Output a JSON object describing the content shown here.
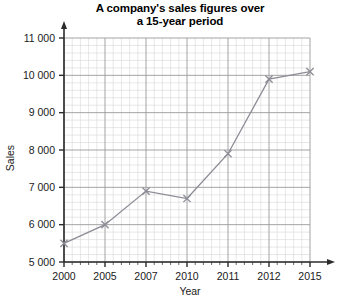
{
  "chart_data": {
    "type": "line",
    "title": "A company's sales figures over a 15-year period",
    "title_line1": "A company's sales figures over",
    "title_line2": "a 15-year period",
    "xlabel": "Year",
    "ylabel": "Sales",
    "categories": [
      "2000",
      "2005",
      "2007",
      "2010",
      "2011",
      "2012",
      "2015"
    ],
    "values": [
      5500,
      6000,
      6900,
      6700,
      7900,
      9900,
      10100
    ],
    "ylim": [
      5000,
      11000
    ],
    "ytick_step": 1000,
    "ytick_labels": [
      "5000",
      "6000",
      "7000",
      "8000",
      "9000",
      "10000",
      "11000"
    ],
    "xtick_labels": [
      "2000",
      "2005",
      "2007",
      "2010",
      "2011",
      "2012",
      "2015"
    ],
    "grid": true,
    "minor_grid": true,
    "minor_per_major": 5,
    "legend": "none",
    "marker": "cross",
    "series_color": "#8c8c96",
    "grid_major_color": "#9a9a9a",
    "grid_minor_color": "#d6d6d6",
    "axis_color": "#2b2b2b"
  }
}
